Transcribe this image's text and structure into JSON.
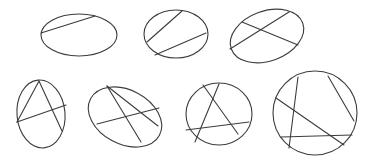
{
  "diagram": {
    "stroke_color": "#3c3c3c",
    "background": "#ffffff",
    "figures": [
      {
        "id": "ellipse-1",
        "ellipse": {
          "cx": 79,
          "cy": 35,
          "rx": 38,
          "ry": 21,
          "rotate": 0
        },
        "chords": [
          [
            41,
            33,
            95,
            16
          ]
        ]
      },
      {
        "id": "ellipse-2",
        "ellipse": {
          "cx": 176,
          "cy": 34,
          "rx": 32,
          "ry": 24,
          "rotate": 0
        },
        "chords": [
          [
            147,
            42,
            182,
            11
          ],
          [
            155,
            55,
            206,
            33
          ]
        ]
      },
      {
        "id": "ellipse-3",
        "ellipse": {
          "cx": 267,
          "cy": 36,
          "rx": 38,
          "ry": 25,
          "rotate": -20
        },
        "chords": [
          [
            242,
            22,
            298,
            45
          ],
          [
            230,
            49,
            289,
            12
          ]
        ]
      },
      {
        "id": "ellipse-4",
        "ellipse": {
          "cx": 41,
          "cy": 114,
          "rx": 24,
          "ry": 34,
          "rotate": -5
        },
        "chords": [
          [
            39,
            81,
            17,
            122
          ],
          [
            39,
            81,
            62,
            131
          ],
          [
            17,
            122,
            66,
            105
          ]
        ]
      },
      {
        "id": "ellipse-5",
        "ellipse": {
          "cx": 125,
          "cy": 117,
          "rx": 39,
          "ry": 27,
          "rotate": 28
        },
        "chords": [
          [
            107,
            86,
            141,
            142
          ],
          [
            107,
            86,
            158,
            126
          ],
          [
            97,
            124,
            159,
            108
          ]
        ]
      },
      {
        "id": "ellipse-6",
        "ellipse": {
          "cx": 219,
          "cy": 114,
          "rx": 33,
          "ry": 31,
          "rotate": 0
        },
        "chords": [
          [
            203,
            85,
            238,
            134
          ],
          [
            219,
            84,
            195,
            142
          ],
          [
            186,
            130,
            249,
            122
          ]
        ]
      },
      {
        "id": "ellipse-7",
        "ellipse": {
          "cx": 315,
          "cy": 113,
          "rx": 42,
          "ry": 42,
          "rotate": 0
        },
        "chords": [
          [
            298,
            77,
            289,
            148
          ],
          [
            328,
            76,
            354,
            121
          ],
          [
            276,
            98,
            344,
            145
          ],
          [
            281,
            137,
            352,
            135
          ]
        ]
      }
    ]
  }
}
